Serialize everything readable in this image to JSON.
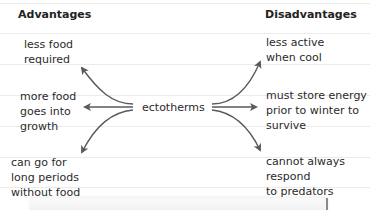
{
  "headers": {
    "left": "Advantages",
    "right": "Disadvantages"
  },
  "center": "ectotherms",
  "advantages": [
    "less food\nrequired",
    "more food\ngoes into\ngrowth",
    "can go for\nlong periods\nwithout food"
  ],
  "disadvantages": [
    "less active\nwhen cool",
    "must store energy\nprior to winter to\nsurvive",
    "cannot always\nrespond\nto predators"
  ],
  "colors": {
    "arrow": "#5a5a5a",
    "rule": "#ebebeb",
    "text": "#2a2a2a"
  }
}
